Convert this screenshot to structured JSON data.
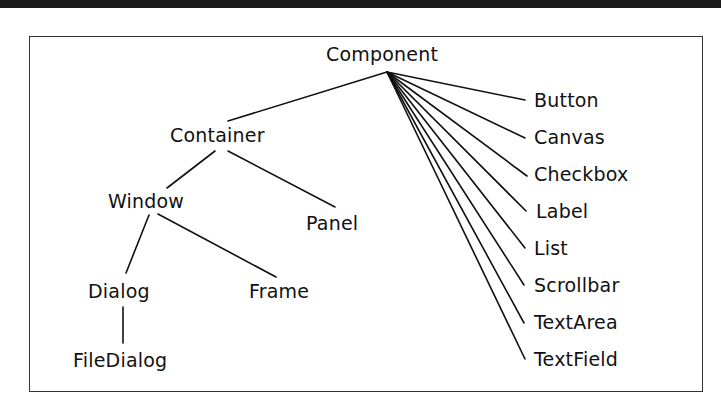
{
  "diagram": {
    "title": "Component",
    "type": "class-hierarchy-tree",
    "colors": {
      "line": "#111111",
      "text": "#111111",
      "border": "#333333",
      "topbar": "#1a1a1a"
    },
    "nodes": {
      "component": "Component",
      "container": "Container",
      "window": "Window",
      "panel": "Panel",
      "dialog": "Dialog",
      "frame": "Frame",
      "filedialog": "FileDialog",
      "button": "Button",
      "canvas": "Canvas",
      "checkbox": "Checkbox",
      "label": "Label",
      "list": "List",
      "scrollbar": "Scrollbar",
      "textarea": "TextArea",
      "textfield": "TextField"
    },
    "edges": [
      [
        "Component",
        "Container"
      ],
      [
        "Component",
        "Button"
      ],
      [
        "Component",
        "Canvas"
      ],
      [
        "Component",
        "Checkbox"
      ],
      [
        "Component",
        "Label"
      ],
      [
        "Component",
        "List"
      ],
      [
        "Component",
        "Scrollbar"
      ],
      [
        "Component",
        "TextArea"
      ],
      [
        "Component",
        "TextField"
      ],
      [
        "Container",
        "Window"
      ],
      [
        "Container",
        "Panel"
      ],
      [
        "Window",
        "Dialog"
      ],
      [
        "Window",
        "Frame"
      ],
      [
        "Dialog",
        "FileDialog"
      ]
    ]
  }
}
